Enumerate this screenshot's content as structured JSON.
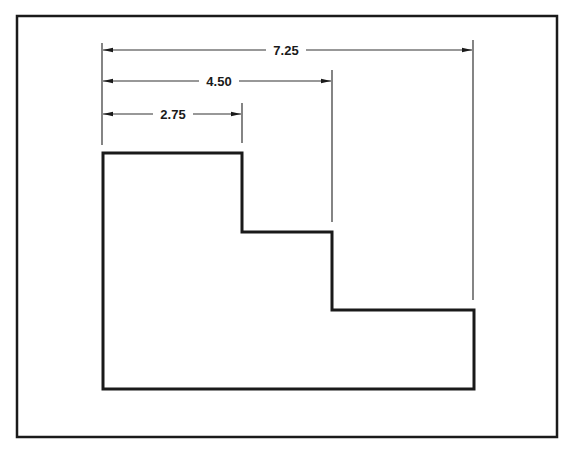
{
  "diagram": {
    "type": "dimensioned-stepped-profile",
    "colors": {
      "background": "#ffffff",
      "stroke": "#1a1a1a",
      "dim_line": "#333333"
    },
    "frame": {
      "x": 17,
      "y": 16,
      "width": 540,
      "height": 421
    },
    "shape": {
      "points": [
        [
          103,
          153
        ],
        [
          242,
          153
        ],
        [
          242,
          232
        ],
        [
          332,
          232
        ],
        [
          332,
          310
        ],
        [
          474,
          310
        ],
        [
          474,
          389
        ],
        [
          103,
          389
        ]
      ]
    },
    "dimensions": [
      {
        "label": "7.25",
        "from_x": 102,
        "to_x": 473,
        "y": 50,
        "text_x": 286
      },
      {
        "label": "4.50",
        "from_x": 102,
        "to_x": 332,
        "y": 81,
        "text_x": 219
      },
      {
        "label": "2.75",
        "from_x": 102,
        "to_x": 242,
        "y": 114,
        "text_x": 173
      }
    ],
    "extension_lines": [
      {
        "x": 102,
        "y1": 43,
        "y2": 145
      },
      {
        "x": 242,
        "y1": 103,
        "y2": 143
      },
      {
        "x": 332,
        "y1": 70,
        "y2": 222
      },
      {
        "x": 473,
        "y1": 40,
        "y2": 300
      }
    ]
  }
}
